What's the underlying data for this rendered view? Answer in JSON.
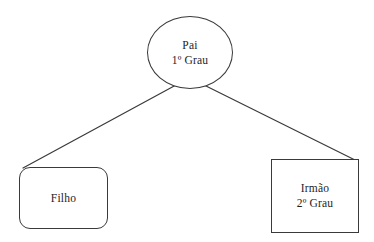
{
  "diagram": {
    "language": "pt-BR",
    "background_color": "#ffffff",
    "stroke_color": "#3a3a3a",
    "text_color": "#1d1d1d",
    "nodes": [
      {
        "id": "pai",
        "shape": "ellipse",
        "lines": [
          "Pai",
          "1º Grau"
        ],
        "label": "Pai",
        "degree": "1º Grau"
      },
      {
        "id": "filho",
        "shape": "rounded-rectangle",
        "lines": [
          "Filho"
        ],
        "label": "Filho",
        "degree": ""
      },
      {
        "id": "irmao",
        "shape": "rectangle",
        "lines": [
          "Irmão",
          "2º Grau"
        ],
        "label": "Irmão",
        "degree": "2º Grau"
      }
    ],
    "edges": [
      {
        "id": "edge-pai-filho",
        "from": "pai",
        "to": "filho",
        "style": "solid"
      },
      {
        "id": "edge-pai-irmao",
        "from": "pai",
        "to": "irmao",
        "style": "solid"
      }
    ]
  }
}
